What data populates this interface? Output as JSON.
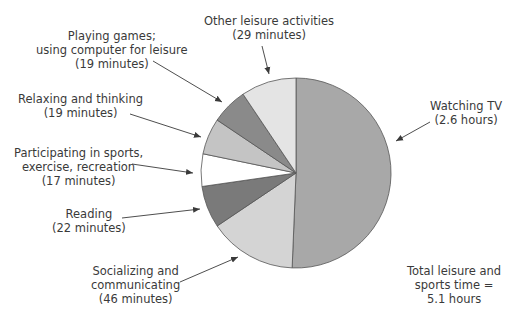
{
  "chart_data": {
    "type": "pie",
    "title": "",
    "unit": "minutes",
    "start_angle_deg": 0,
    "direction": "clockwise",
    "slices": [
      {
        "name": "Watching TV",
        "label_value": "(2.6 hours)",
        "minutes": 156,
        "color": "#a8a8a8"
      },
      {
        "name": "Socializing and communicating",
        "label_value": "(46 minutes)",
        "minutes": 46,
        "color": "#d4d4d4"
      },
      {
        "name": "Reading",
        "label_value": "(22 minutes)",
        "minutes": 22,
        "color": "#7a7a7a"
      },
      {
        "name": "Participating in sports, exercise, recreation",
        "label_value": "(17 minutes)",
        "minutes": 17,
        "color": "#ffffff"
      },
      {
        "name": "Relaxing and thinking",
        "label_value": "(19 minutes)",
        "minutes": 19,
        "color": "#c4c4c4"
      },
      {
        "name": "Playing games; using computer for leisure",
        "label_value": "(19 minutes)",
        "minutes": 19,
        "color": "#8a8a8a"
      },
      {
        "name": "Other leisure activities",
        "label_value": "(29 minutes)",
        "minutes": 29,
        "color": "#e4e4e4"
      }
    ],
    "annotation": "Total leisure and sports time = 5.1 hours"
  },
  "labels": {
    "other": [
      "Other leisure activities",
      "(29 minutes)"
    ],
    "games": [
      "Playing games;",
      "using computer for leisure",
      "(19 minutes)"
    ],
    "relaxing": [
      "Relaxing and thinking",
      "(19 minutes)"
    ],
    "sports": [
      "Participating in sports,",
      "exercise, recreation",
      "(17 minutes)"
    ],
    "reading": [
      "Reading",
      "(22 minutes)"
    ],
    "socializing": [
      "Socializing and",
      "communicating",
      "(46 minutes)"
    ],
    "tv": [
      "Watching TV",
      "(2.6 hours)"
    ],
    "total": [
      "Total leisure and",
      "sports time =",
      "5.1 hours"
    ]
  }
}
